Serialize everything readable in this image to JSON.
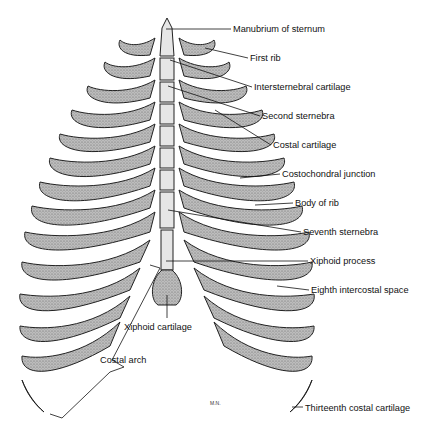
{
  "figure": {
    "signature": "M.N.",
    "labels": [
      {
        "text": "Manubrium of sternum",
        "x": 233,
        "y": 24
      },
      {
        "text": "First rib",
        "x": 250,
        "y": 53
      },
      {
        "text": "Intersternebral cartilage",
        "x": 254,
        "y": 82
      },
      {
        "text": "Second sternebra",
        "x": 262,
        "y": 111
      },
      {
        "text": "Costal cartilage",
        "x": 273,
        "y": 140
      },
      {
        "text": "Costochondral junction",
        "x": 282,
        "y": 169
      },
      {
        "text": "Body of rib",
        "x": 295,
        "y": 198
      },
      {
        "text": "Seventh sternebra",
        "x": 303,
        "y": 227
      },
      {
        "text": "Xiphoid process",
        "x": 310,
        "y": 256
      },
      {
        "text": "Eighth intercostal space",
        "x": 311,
        "y": 285
      },
      {
        "text": "Xiphoid cartilage",
        "x": 124,
        "y": 322
      },
      {
        "text": "Costal arch",
        "x": 100,
        "y": 355
      },
      {
        "text": "Thirteenth costal cartilage",
        "x": 305,
        "y": 403
      }
    ]
  }
}
